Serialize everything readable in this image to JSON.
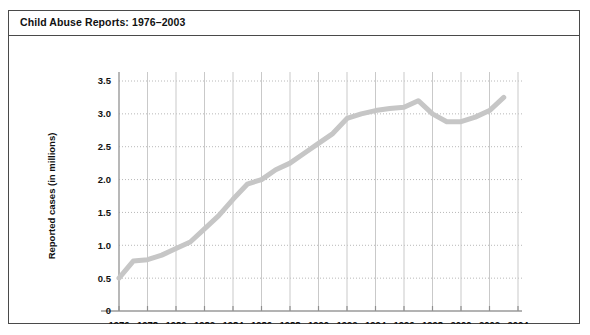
{
  "figure": {
    "title": "Child Abuse Reports: 1976–2003",
    "border_color": "#4a4a4a",
    "background": "#ffffff"
  },
  "chart_data": {
    "type": "line",
    "title": "Child Abuse Reports: 1976–2003",
    "xlabel": "",
    "ylabel": "Reported cases (in millions)",
    "xlim": [
      1976,
      2004
    ],
    "ylim": [
      0,
      3.5
    ],
    "x_ticks": [
      1976,
      1978,
      1980,
      1982,
      1984,
      1986,
      1988,
      1990,
      1992,
      1994,
      1996,
      1998,
      2000,
      2002,
      2004
    ],
    "x_tick_labels": [
      "1976",
      "1978",
      "1980",
      "1982",
      "1984",
      "1986",
      "1988",
      "1990",
      "1992",
      "1994",
      "1996",
      "1998",
      "2000",
      "2002",
      "2004"
    ],
    "y_ticks": [
      0,
      0.5,
      1.0,
      1.5,
      2.0,
      2.5,
      3.0,
      3.5
    ],
    "y_tick_labels": [
      "0",
      "0.5",
      "1.0",
      "1.5",
      "2.0",
      "2.5",
      "3.0",
      "3.5"
    ],
    "grid": {
      "horizontal": "dotted",
      "vertical": "solid",
      "horizontal_color": "#b8b8b8",
      "vertical_color": "#c9c9c9"
    },
    "legend": null,
    "series": [
      {
        "name": "Reported cases",
        "color": "#c6c6c6",
        "line_width": 5,
        "x": [
          1976,
          1977,
          1978,
          1979,
          1980,
          1981,
          1982,
          1983,
          1984,
          1985,
          1986,
          1987,
          1988,
          1989,
          1990,
          1991,
          1992,
          1993,
          1994,
          1995,
          1996,
          1997,
          1998,
          1999,
          2000,
          2001,
          2002,
          2003
        ],
        "values": [
          0.5,
          0.76,
          0.78,
          0.85,
          0.95,
          1.05,
          1.25,
          1.45,
          1.7,
          1.93,
          2.0,
          2.15,
          2.25,
          2.4,
          2.55,
          2.7,
          2.93,
          3.0,
          3.05,
          3.08,
          3.1,
          3.2,
          3.0,
          2.88,
          2.88,
          2.95,
          3.05,
          3.25
        ]
      }
    ]
  }
}
